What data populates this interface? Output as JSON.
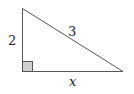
{
  "diagram": {
    "type": "right-triangle",
    "labels": {
      "vertical_leg": "2",
      "hypotenuse": "3",
      "horizontal_leg": "x"
    },
    "colors": {
      "stroke": "#555555",
      "right_angle_fill": "#cfcfcf",
      "text": "#222222"
    }
  }
}
